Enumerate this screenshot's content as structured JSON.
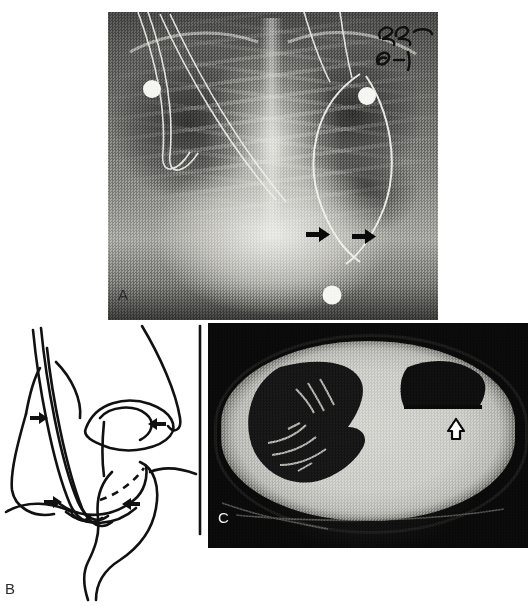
{
  "figure": {
    "type": "multi-panel-medical-figure",
    "background_color": "#ffffff",
    "width": 531,
    "height": 606,
    "panel_count": 3
  },
  "panels": [
    {
      "id": "A",
      "label": "A",
      "label_color": "#2b2b2b",
      "modality": "chest-radiograph",
      "description": "Frontal chest radiograph of an infant with ECG electrodes, monitoring leads and a curved indwelling catheter/tube; paired solid arrows indicate an abnormality at the left hemidiaphragm region.",
      "annotations": [
        {
          "name": "arrow-left",
          "style": "solid",
          "direction": "right",
          "x": 316,
          "y": 232
        },
        {
          "name": "arrow-right",
          "style": "solid",
          "direction": "right",
          "x": 362,
          "y": 234
        }
      ],
      "markers": [
        {
          "name": "ecg-electrode-right-upper",
          "x": 152,
          "y": 89
        },
        {
          "name": "ecg-electrode-left-upper",
          "x": 367,
          "y": 96
        },
        {
          "name": "ecg-electrode-lower",
          "x": 332,
          "y": 295
        }
      ],
      "handwriting": [
        "EEG",
        "6-1"
      ]
    },
    {
      "id": "B",
      "label": "B",
      "label_color": "#2b2b2b",
      "modality": "line-diagram",
      "description": "Schematic line drawing showing the esophagus/tube course, stomach and adjacent structures; four solid arrows mark the points of interest, with a dashed line indicating a hidden border.",
      "annotations": [
        {
          "name": "arrow-upper-left",
          "style": "solid",
          "direction": "right",
          "x": 38,
          "y": 416
        },
        {
          "name": "arrow-upper-right",
          "style": "solid",
          "direction": "left",
          "x": 158,
          "y": 424
        },
        {
          "name": "arrow-lower-left",
          "style": "solid",
          "direction": "right",
          "x": 49,
          "y": 500
        },
        {
          "name": "arrow-lower-right",
          "style": "solid",
          "direction": "left",
          "x": 134,
          "y": 503
        }
      ]
    },
    {
      "id": "C",
      "label": "C",
      "label_color": "#f2f2f2",
      "modality": "axial-ct",
      "description": "Axial CT image of the chest showing an aerated right lung with bronchovascular markings and an air-containing collection in the left side; an open arrow points to the air–fluid interface.",
      "annotations": [
        {
          "name": "open-arrow",
          "style": "open-outline",
          "direction": "up",
          "x": 449,
          "y": 424
        }
      ]
    }
  ]
}
